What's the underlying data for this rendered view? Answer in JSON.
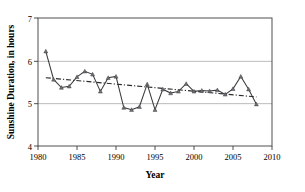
{
  "chart_data": {
    "type": "line",
    "title": "",
    "xlabel": "Year",
    "ylabel": "Sunshine Duration, in hours",
    "xlim": [
      1980,
      2010
    ],
    "ylim": [
      4,
      7
    ],
    "xticks": [
      1980,
      1985,
      1990,
      1995,
      2000,
      2005,
      2010
    ],
    "yticks": [
      4,
      5,
      6,
      7
    ],
    "xtick_labels": [
      "1980",
      "1985",
      "1990",
      "1995",
      "2000",
      "2005",
      "2010"
    ],
    "ytick_labels": [
      "4",
      "5",
      "6",
      "7"
    ],
    "grid": "horizontal-at-5-and-6",
    "legend": "none",
    "x": [
      1981,
      1982,
      1983,
      1984,
      1985,
      1986,
      1987,
      1988,
      1989,
      1990,
      1991,
      1992,
      1993,
      1994,
      1995,
      1996,
      1997,
      1998,
      1999,
      2000,
      2001,
      2002,
      2003,
      2004,
      2005,
      2006,
      2007,
      2008
    ],
    "series": [
      {
        "name": "Sunshine Duration",
        "style": "solid-with-markers",
        "marker": "triangle",
        "color": "#3a3a3a",
        "values": [
          6.22,
          5.56,
          5.37,
          5.4,
          5.62,
          5.75,
          5.68,
          5.28,
          5.6,
          5.63,
          4.9,
          4.85,
          4.92,
          5.45,
          4.85,
          5.33,
          5.24,
          5.28,
          5.46,
          5.28,
          5.3,
          5.29,
          5.31,
          5.21,
          5.34,
          5.63,
          5.33,
          4.98
        ]
      },
      {
        "name": "Linear trend",
        "style": "dash-dot",
        "color": "#2b2b2b",
        "x_endpoints": [
          1981,
          2008
        ],
        "y_endpoints": [
          5.6,
          5.15
        ]
      }
    ]
  },
  "axes": {
    "x_title": "Year",
    "y_title": "Sunshine Duration, in hours"
  }
}
